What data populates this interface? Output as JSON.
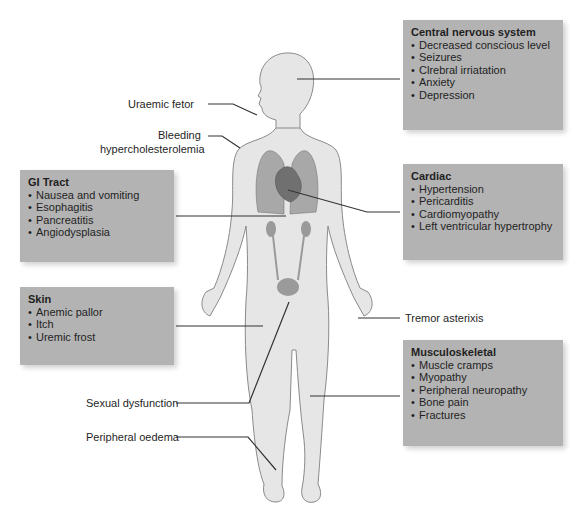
{
  "diagram": {
    "colors": {
      "box_fill": "#b3b3b3",
      "body_fill": "#e6e6e6",
      "body_stroke": "#8a8a8a",
      "organ_fill": "#8f8f8f",
      "leader_line": "#333333"
    },
    "boxes": {
      "cns": {
        "title": "Central nervous system",
        "items": [
          "Decreased conscious level",
          "Seizures",
          "Clrebral irriatation",
          "Anxiety",
          "Depression"
        ]
      },
      "cardiac": {
        "title": "Cardiac",
        "items": [
          "Hypertension",
          "Pericarditis",
          "Cardiomyopathy",
          "Left ventricular hypertrophy"
        ]
      },
      "gi": {
        "title": "GI Tract",
        "items": [
          "Nausea and vomiting",
          "Esophagitis",
          "Pancreatitis",
          "Angiodysplasia"
        ]
      },
      "skin": {
        "title": "Skin",
        "items": [
          "Anemic pallor",
          "Itch",
          "Uremic frost"
        ]
      },
      "msk": {
        "title": "Musculoskeletal",
        "items": [
          "Muscle cramps",
          "Myopathy",
          "Peripheral neuropathy",
          "Bone pain",
          "Fractures"
        ]
      }
    },
    "labels": {
      "uraemic_fetor": "Uraemic fetor",
      "bleeding_line1": "Bleeding",
      "bleeding_line2": "hypercholesterolemia",
      "tremor": "Tremor asterixis",
      "sexual": "Sexual dysfunction",
      "oedema": "Peripheral oedema"
    }
  }
}
